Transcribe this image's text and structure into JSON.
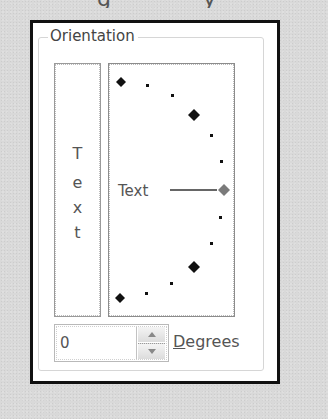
{
  "top_fragments": {
    "glyphs": [
      {
        "char": "g",
        "x": 97
      },
      {
        "char": "y",
        "x": 203
      }
    ]
  },
  "orientation": {
    "group_label": "Orientation",
    "vertical_text": {
      "letters": [
        "T",
        "e",
        "x",
        "t"
      ]
    },
    "dial": {
      "label": "Text",
      "selected_angle": 0,
      "colors": {
        "major_marker": "#111111",
        "minor_marker": "#111111",
        "selected_marker": "#7a7a7a",
        "indicator_line": "#333333"
      }
    },
    "degrees": {
      "value": "0",
      "label_mnemonic": "D",
      "label_rest": "egrees",
      "up_icon": "spin-up-arrow",
      "down_icon": "spin-down-arrow"
    }
  }
}
